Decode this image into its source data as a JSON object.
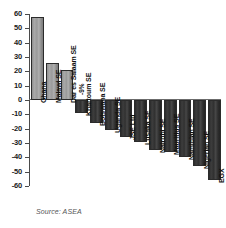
{
  "chart_data": {
    "type": "bar",
    "title": "",
    "xlabel": "",
    "ylabel": "",
    "ylim": [
      -60,
      60
    ],
    "ytick_step": 10,
    "grid": false,
    "legend": null,
    "orientation": "vertical",
    "categories": [
      "Ghana",
      "Malawi SE",
      "Dar es Salaam SE",
      "Khartoum SE",
      "Botswana SE",
      "Uganda SE",
      "JSE Ltd",
      "Lusaka SE",
      "Nairobi SE",
      "Mauritius SE",
      "Namibian SE",
      "Nigerian SE",
      "EGX"
    ],
    "values": [
      58,
      26,
      21,
      -9,
      -16,
      -21,
      -26,
      -29,
      -35,
      -36,
      -40,
      -46,
      -56
    ],
    "data_labels": [
      "+58%",
      "+26%",
      "+21%",
      "-9%",
      "-16%",
      "-21%",
      "-26%",
      "-29%",
      "-35%",
      "-36%",
      "-40%",
      "-46%",
      "-56%"
    ],
    "ytick_labels": [
      "60",
      "50",
      "40",
      "30",
      "20",
      "10",
      "0",
      "-10",
      "-20",
      "-30",
      "-40",
      "-50",
      "-60"
    ],
    "ytick_values": [
      60,
      50,
      40,
      30,
      20,
      10,
      0,
      -10,
      -20,
      -30,
      -40,
      -50,
      -60
    ],
    "colors": {
      "positive_bar": "#9a9a9a",
      "negative_bar": "#333333",
      "bar_outline": "#2b2b2b",
      "axis": "#4a4a4a",
      "zero_line": "#6b6b6b",
      "background": "#ffffff",
      "label_inside": "#ffffff",
      "label_text": "#111111",
      "source_text": "#555555"
    }
  },
  "source": {
    "text": "Source: ASEA"
  }
}
